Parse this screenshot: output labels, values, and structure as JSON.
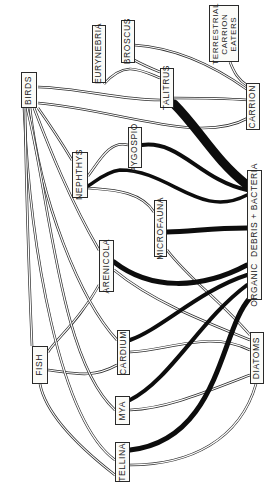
{
  "diagram": {
    "type": "food-web",
    "orientation": "rotated-90-ccw",
    "colors": {
      "background": "#ffffff",
      "line": "#1a1a1a",
      "box_border": "#2a2a2a",
      "box_fill": "#fbfbf8"
    },
    "nodes": [
      {
        "id": "birds",
        "label": "BIRDS",
        "x": 21,
        "y": 72,
        "w": 16,
        "h": 36
      },
      {
        "id": "eurynebria",
        "label": "EURYNEBRIA",
        "x": 92,
        "y": 25,
        "w": 14,
        "h": 58
      },
      {
        "id": "broscus",
        "label": "BROSCUS",
        "x": 121,
        "y": 20,
        "w": 14,
        "h": 43
      },
      {
        "id": "terrestrial",
        "label": "TERRESTRIAL\nCARRION\nEATERS",
        "x": 209,
        "y": 5,
        "w": 30,
        "h": 57,
        "multi": true
      },
      {
        "id": "talitrus",
        "label": "TALITRUS",
        "x": 160,
        "y": 68,
        "w": 14,
        "h": 40
      },
      {
        "id": "carrion",
        "label": "CARRION",
        "x": 246,
        "y": 83,
        "w": 14,
        "h": 47
      },
      {
        "id": "nephthys",
        "label": "NEPHTHYS",
        "x": 72,
        "y": 152,
        "w": 16,
        "h": 46
      },
      {
        "id": "pygospio",
        "label": "PYGOSPIO",
        "x": 128,
        "y": 127,
        "w": 14,
        "h": 41
      },
      {
        "id": "microfauna",
        "label": "MICROFAUNA",
        "x": 154,
        "y": 200,
        "w": 13,
        "h": 57
      },
      {
        "id": "organic",
        "label": "ORGANIC  DEBRIS + BACTERIA",
        "x": 247,
        "y": 170,
        "w": 15,
        "h": 130
      },
      {
        "id": "arenicola",
        "label": "ARENICOLA",
        "x": 99,
        "y": 240,
        "w": 15,
        "h": 52
      },
      {
        "id": "fish",
        "label": "FISH",
        "x": 32,
        "y": 346,
        "w": 16,
        "h": 38
      },
      {
        "id": "cardium",
        "label": "CARDIUM",
        "x": 117,
        "y": 330,
        "w": 13,
        "h": 45
      },
      {
        "id": "diatoms",
        "label": "DIATOMS",
        "x": 250,
        "y": 332,
        "w": 14,
        "h": 52
      },
      {
        "id": "mya",
        "label": "MYA",
        "x": 115,
        "y": 396,
        "w": 15,
        "h": 29
      },
      {
        "id": "tellina",
        "label": "TELLINA",
        "x": 115,
        "y": 442,
        "w": 15,
        "h": 40
      }
    ],
    "edges_thick": [
      {
        "from": "organic",
        "to": "talitrus",
        "weight": 7
      },
      {
        "from": "organic",
        "to": "pygospio",
        "weight": 3
      },
      {
        "from": "organic",
        "to": "nephthys",
        "weight": 3
      },
      {
        "from": "organic",
        "to": "microfauna",
        "weight": 4
      },
      {
        "from": "organic",
        "to": "arenicola",
        "weight": 4
      },
      {
        "from": "organic",
        "to": "cardium",
        "weight": 3
      },
      {
        "from": "organic",
        "to": "mya",
        "weight": 3
      },
      {
        "from": "organic",
        "to": "tellina",
        "weight": 3.5
      }
    ],
    "edges_thin": [
      {
        "from": "talitrus",
        "to": "eurynebria"
      },
      {
        "from": "talitrus",
        "to": "broscus"
      },
      {
        "from": "talitrus",
        "to": "birds"
      },
      {
        "from": "carrion",
        "to": "broscus"
      },
      {
        "from": "carrion",
        "to": "terrestrial"
      },
      {
        "from": "carrion",
        "to": "talitrus"
      },
      {
        "from": "carrion",
        "to": "birds"
      },
      {
        "from": "pygospio",
        "to": "nephthys"
      },
      {
        "from": "microfauna",
        "to": "nephthys"
      },
      {
        "from": "nephthys",
        "to": "birds"
      },
      {
        "from": "arenicola",
        "to": "birds"
      },
      {
        "from": "arenicola",
        "to": "fish"
      },
      {
        "from": "cardium",
        "to": "birds"
      },
      {
        "from": "cardium",
        "to": "fish"
      },
      {
        "from": "mya",
        "to": "birds"
      },
      {
        "from": "tellina",
        "to": "birds"
      },
      {
        "from": "tellina",
        "to": "fish"
      },
      {
        "from": "diatoms",
        "to": "cardium"
      },
      {
        "from": "diatoms",
        "to": "mya"
      },
      {
        "from": "diatoms",
        "to": "tellina"
      },
      {
        "from": "diatoms",
        "to": "arenicola"
      },
      {
        "from": "diatoms",
        "to": "microfauna"
      },
      {
        "from": "fish",
        "to": "birds"
      }
    ]
  }
}
